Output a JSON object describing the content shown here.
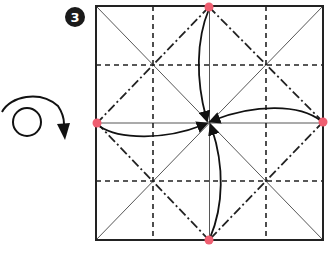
{
  "diagram": {
    "type": "origami-instruction-step",
    "step": {
      "number": "3",
      "badge_center": [
        75,
        17
      ],
      "badge_radius": 10,
      "badge_color": "#1a1a1a"
    },
    "flip_symbol": {
      "meaning": "turn-over",
      "circle_center": [
        27,
        122
      ],
      "circle_radius": 14
    },
    "paper_square": {
      "x": 96,
      "y": 6,
      "width": 227,
      "height": 234,
      "border_color": "#222222"
    },
    "legend_semantics": {
      "solid_thin": "existing crease (diagonals and center lines)",
      "dashed": "valley fold (quarter lines)",
      "dash_dot": "mountain fold (diamond connecting edge midpoints)",
      "pink_dots": "reference points to bring to center",
      "arrows": "fold edge midpoints to center"
    },
    "reference_points": [
      {
        "name": "top-mid",
        "x": 209,
        "y": 7
      },
      {
        "name": "right-mid",
        "x": 323,
        "y": 122
      },
      {
        "name": "bottom-mid",
        "x": 209,
        "y": 240
      },
      {
        "name": "left-mid",
        "x": 97,
        "y": 123
      }
    ],
    "center_point": [
      209,
      123
    ],
    "colors": {
      "line": "#222222",
      "point": "#ef5f71"
    }
  }
}
